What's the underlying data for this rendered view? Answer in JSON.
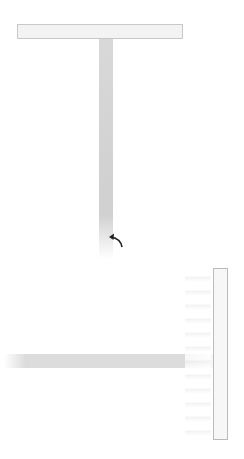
{
  "projection": {
    "top_row": [
      0,
      0,
      0,
      26,
      51,
      58,
      59,
      53,
      29,
      0,
      0,
      0
    ],
    "highlighted_column_index": 6
  },
  "backprojected_grid": {
    "rows": [
      [
        0,
        0,
        0,
        26,
        51,
        58,
        59,
        53,
        29,
        0,
        0,
        0
      ],
      [
        0,
        0,
        0,
        26,
        51,
        58,
        59,
        53,
        29,
        0,
        0,
        0
      ],
      [
        0,
        0,
        0,
        26,
        51,
        58,
        59,
        53,
        29,
        0,
        0,
        0
      ],
      [
        0,
        0,
        0,
        26,
        51,
        58,
        59,
        53,
        29,
        0,
        0,
        0
      ],
      [
        0,
        0,
        0,
        26,
        51,
        58,
        59,
        53,
        29,
        0,
        0,
        0
      ],
      [
        0,
        0,
        0,
        26,
        51,
        58,
        59,
        53,
        29,
        0,
        0,
        0
      ],
      [
        0,
        0,
        0,
        26,
        51,
        58,
        59,
        53,
        29,
        0,
        0,
        0
      ],
      [
        0,
        0,
        0,
        26,
        51,
        58,
        59,
        53,
        29,
        0,
        0,
        0
      ],
      [
        0,
        0,
        0,
        26,
        51,
        58,
        59,
        53,
        29,
        0,
        0,
        0
      ],
      [
        0,
        0,
        0,
        26,
        51,
        58,
        59,
        53,
        29,
        0,
        0,
        0
      ],
      [
        0,
        0,
        0,
        26,
        51,
        58,
        59,
        53,
        29,
        0,
        0,
        0
      ],
      [
        0,
        0,
        0,
        26,
        51,
        58,
        59,
        53,
        29,
        0,
        0,
        0
      ]
    ]
  },
  "annotation": {
    "label": "ray-sum"
  },
  "summed_grid": {
    "rows": [
      [
        0,
        0,
        0,
        26,
        51,
        58,
        59,
        53,
        29,
        0,
        0,
        0
      ],
      [
        0,
        0,
        0,
        26,
        51,
        58,
        59,
        53,
        29,
        0,
        0,
        0
      ],
      [
        12,
        12,
        12,
        38,
        63,
        70,
        71,
        65,
        41,
        12,
        12,
        12
      ],
      [
        43,
        43,
        43,
        69,
        94,
        101,
        102,
        96,
        72,
        43,
        43,
        43
      ],
      [
        52,
        52,
        52,
        78,
        103,
        110,
        111,
        116,
        81,
        52,
        52,
        52
      ],
      [
        58,
        58,
        58,
        84,
        109,
        116,
        117,
        111,
        87,
        58,
        58,
        58
      ],
      [
        54,
        54,
        54,
        80,
        105,
        112,
        113,
        108,
        83,
        54,
        54,
        54
      ],
      [
        46,
        46,
        46,
        72,
        96,
        114,
        115,
        99,
        75,
        46,
        46,
        46
      ],
      [
        10,
        10,
        10,
        36,
        61,
        68,
        69,
        63,
        39,
        10,
        10,
        10
      ],
      [
        0,
        0,
        0,
        26,
        51,
        58,
        59,
        53,
        29,
        0,
        0,
        0
      ],
      [
        0,
        0,
        0,
        26,
        51,
        58,
        59,
        53,
        29,
        0,
        0,
        0
      ],
      [
        0,
        0,
        0,
        26,
        51,
        58,
        59,
        53,
        29,
        0,
        0,
        0
      ]
    ],
    "highlighted_row_index": 6
  },
  "side_projection": [
    0,
    0,
    12,
    43,
    52,
    58,
    54,
    46,
    10,
    0,
    0,
    0
  ],
  "colors": {
    "highlight": "#d4d4d4",
    "grid_line": "#ececec",
    "border": "#c8c8c8"
  }
}
